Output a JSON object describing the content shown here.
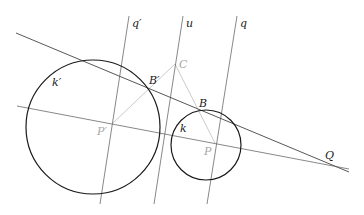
{
  "diagram": {
    "type": "geometry-construction",
    "colors": {
      "primary_stroke": "#1a1a1a",
      "secondary_stroke": "#c4c4c4",
      "background": "#ffffff"
    },
    "circles": [
      {
        "id": "k_prime",
        "label": "k′",
        "cx": 93,
        "cy": 127,
        "r": 67,
        "label_x": 52,
        "label_y": 86
      },
      {
        "id": "k",
        "label": "k",
        "cx": 206,
        "cy": 145,
        "r": 35,
        "label_x": 180,
        "label_y": 132
      }
    ],
    "lines": [
      {
        "id": "q_prime",
        "label": "q′",
        "x1": 129,
        "y1": 16,
        "x2": 100,
        "y2": 204,
        "label_x": 132,
        "label_y": 27
      },
      {
        "id": "u",
        "label": "u",
        "x1": 183,
        "y1": 16,
        "x2": 154,
        "y2": 204,
        "label_x": 186,
        "label_y": 27
      },
      {
        "id": "q",
        "label": "q",
        "x1": 237,
        "y1": 16,
        "x2": 207,
        "y2": 204,
        "label_x": 240,
        "label_y": 27
      },
      {
        "id": "tangent",
        "label": "",
        "x1": 16,
        "y1": 33,
        "x2": 349,
        "y2": 172
      },
      {
        "id": "center_line",
        "label": "",
        "x1": 17,
        "y1": 106,
        "x2": 349,
        "y2": 169
      }
    ],
    "construction_segments": [
      {
        "from": "P_prime",
        "to": "C"
      },
      {
        "from": "C",
        "to": "P"
      }
    ],
    "points": [
      {
        "id": "C",
        "label": "C",
        "x": 175,
        "y": 64,
        "label_x": 179,
        "label_y": 68,
        "style": "grey"
      },
      {
        "id": "B_prime",
        "label": "B′",
        "x": 149,
        "y": 89,
        "label_x": 149,
        "label_y": 84,
        "style": "dark"
      },
      {
        "id": "B",
        "label": "B",
        "x": 200,
        "y": 109,
        "label_x": 199,
        "label_y": 107,
        "style": "dark"
      },
      {
        "id": "P_prime",
        "label": "P′",
        "x": 113,
        "y": 123,
        "label_x": 97,
        "label_y": 135,
        "style": "grey"
      },
      {
        "id": "P",
        "label": "P",
        "x": 215,
        "y": 143,
        "label_x": 204,
        "label_y": 155,
        "style": "grey"
      },
      {
        "id": "Q",
        "label": "Q",
        "x": 330,
        "y": 165,
        "label_x": 325,
        "label_y": 159,
        "style": "dark"
      }
    ]
  }
}
